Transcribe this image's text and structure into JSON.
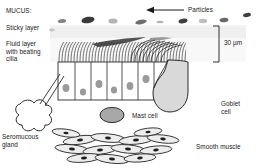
{
  "diagram": {
    "title_implicit": "Airway mucosa structure",
    "scale": {
      "value": "30 µm"
    },
    "labels": {
      "mucus_heading": "MUCUS:",
      "sticky_layer": "Sticky layer",
      "fluid_layer": "Fluid layer\nwith beating\ncilia",
      "particles": "Particles",
      "goblet_cell": "Goblet\ncell",
      "mast_cell": "Mast cell",
      "seromucous_gland": "Seromucous\ngland",
      "smooth_muscle": "Smooth muscle"
    },
    "colors": {
      "ink": "#1a1a1a",
      "stroke": "#2b2b2b",
      "sticky_layer_fill": "#efefef",
      "fluid_layer_fill": "#f7f7f7",
      "epithelium_fill": "#ffffff",
      "nucleus_fill": "#9a9a9a",
      "goblet_fill": "#d8d8d8",
      "mast_fill": "#a8a8a8",
      "gland_fill": "#ffffff",
      "muscle_fill": "#e8e8e8",
      "particle_dark": "#3a3a3a",
      "particle_mid": "#6f6f6f",
      "particle_light": "#b4b4b4"
    },
    "particles": [
      {
        "cx": 62,
        "cy": 21,
        "rx": 4.2,
        "ry": 2.0,
        "rot": -8,
        "tone": "particle_mid"
      },
      {
        "cx": 88,
        "cy": 20,
        "rx": 6.6,
        "ry": 3.2,
        "rot": -10,
        "tone": "particle_dark"
      },
      {
        "cx": 113,
        "cy": 21,
        "rx": 4.6,
        "ry": 2.6,
        "rot": 0,
        "tone": "particle_light"
      },
      {
        "cx": 141,
        "cy": 22,
        "rx": 5.8,
        "ry": 2.2,
        "rot": -12,
        "tone": "particle_mid"
      },
      {
        "cx": 160,
        "cy": 22,
        "rx": 3.4,
        "ry": 1.2,
        "rot": 0,
        "tone": "particle_light"
      },
      {
        "cx": 183,
        "cy": 21,
        "rx": 4.6,
        "ry": 2.2,
        "rot": -14,
        "tone": "particle_dark"
      },
      {
        "cx": 203,
        "cy": 21,
        "rx": 4.2,
        "ry": 2.2,
        "rot": 0,
        "tone": "particle_light"
      },
      {
        "cx": 224,
        "cy": 20,
        "rx": 4.4,
        "ry": 2.2,
        "rot": -8,
        "tone": "particle_mid"
      },
      {
        "cx": 247,
        "cy": 16,
        "rx": 4.0,
        "ry": 2.0,
        "rot": -8,
        "tone": "particle_dark"
      },
      {
        "cx": 18,
        "cy": 12,
        "rx": 0.1,
        "ry": 0.1,
        "rot": 0,
        "tone": "particle_light"
      }
    ],
    "epithelial_cells": [
      {
        "x": 58,
        "w": 17,
        "nucleus_dx": 8,
        "nucleus_dy": 26
      },
      {
        "x": 75,
        "w": 16,
        "nucleus_dx": 8,
        "nucleus_dy": 30
      },
      {
        "x": 91,
        "w": 16,
        "nucleus_dx": 8,
        "nucleus_dy": 22
      },
      {
        "x": 107,
        "w": 15,
        "nucleus_dx": 7,
        "nucleus_dy": 28
      },
      {
        "x": 122,
        "w": 16,
        "nucleus_dx": 8,
        "nucleus_dy": 24
      },
      {
        "x": 138,
        "w": 16,
        "nucleus_dx": 8,
        "nucleus_dy": 18
      },
      {
        "x": 154,
        "w": 16,
        "nucleus_dx": 8,
        "nucleus_dy": 30
      },
      {
        "x": 170,
        "w": 15,
        "nucleus_dx": 7,
        "nucleus_dy": 22
      }
    ],
    "layer_geometry": {
      "sticky_top": 26,
      "sticky_bottom": 38,
      "fluid_bottom": 62,
      "epithelium_top": 62,
      "epithelium_bottom": 100,
      "left": 58,
      "right": 186
    }
  }
}
